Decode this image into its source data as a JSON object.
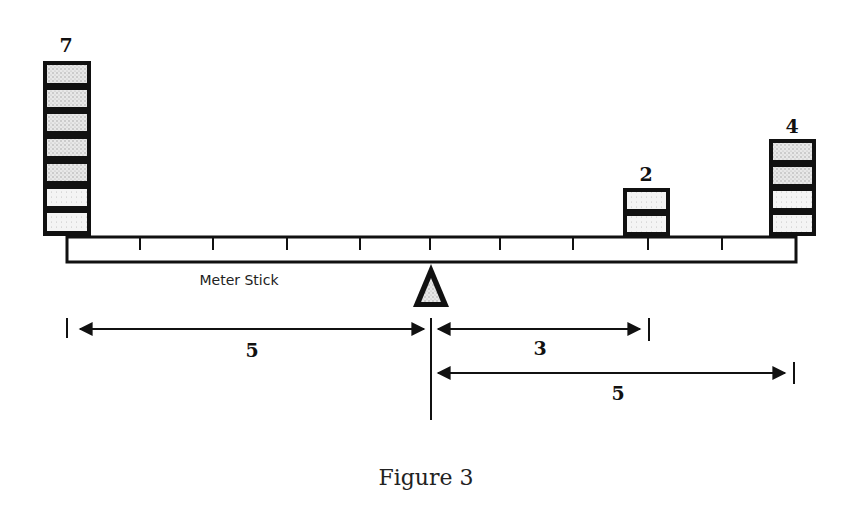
{
  "figure": {
    "caption": "Figure 3",
    "stick_label": "Meter Stick",
    "stacks": [
      {
        "id": "left",
        "count_label": "7",
        "count": 7,
        "position_units": -5
      },
      {
        "id": "middle-right",
        "count_label": "2",
        "count": 2,
        "position_units": 3
      },
      {
        "id": "far-right",
        "count_label": "4",
        "count": 4,
        "position_units": 5
      }
    ],
    "dimensions": [
      {
        "id": "left-distance",
        "label": "5",
        "from": -5,
        "to": 0
      },
      {
        "id": "right-near-distance",
        "label": "3",
        "from": 0,
        "to": 3
      },
      {
        "id": "right-far-distance",
        "label": "5",
        "from": 0,
        "to": 5
      }
    ],
    "colors": {
      "ink": "#111111",
      "block_fill": "#d9d9d9",
      "block_fill_light": "#efefef",
      "background": "#ffffff"
    }
  }
}
